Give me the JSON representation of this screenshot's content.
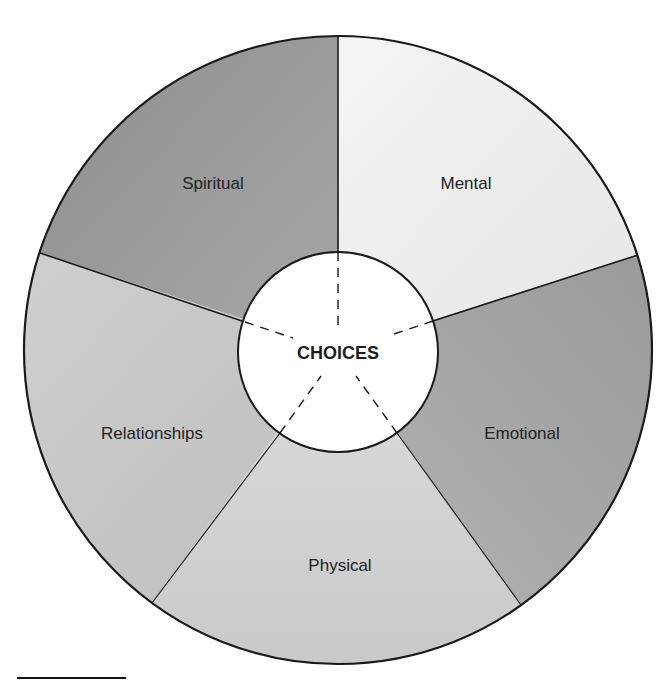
{
  "diagram": {
    "center_label": "CHOICES",
    "segments": [
      {
        "id": "spiritual",
        "label": "Spiritual",
        "fill": "#9c9c9c"
      },
      {
        "id": "mental",
        "label": "Mental",
        "fill": "#efefef"
      },
      {
        "id": "emotional",
        "label": "Emotional",
        "fill": "#a9a9a9"
      },
      {
        "id": "physical",
        "label": "Physical",
        "fill": "#d3d3d3"
      },
      {
        "id": "relationships",
        "label": "Relationships",
        "fill": "#c6c6c6"
      }
    ],
    "colors": {
      "outline": "#1a1a1a",
      "center_fill": "#ffffff",
      "text": "#222222"
    }
  }
}
